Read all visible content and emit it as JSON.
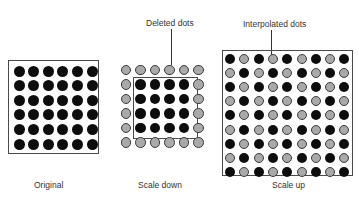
{
  "panels": {
    "original": {
      "caption": "Original",
      "rows": 6,
      "cols": 6,
      "pattern": "all-black"
    },
    "scale_down": {
      "caption": "Scale down",
      "callout": "Deleted dots",
      "rows": 6,
      "cols": 6,
      "pattern": "outer ring gray (deleted), inner 4x4 black (kept)"
    },
    "scale_up": {
      "caption": "Scale up",
      "callout": "Interpolated dots",
      "rows": 9,
      "cols": 9,
      "pattern": "checkerboard: black where (row+col) even, gray (interpolated) where odd"
    }
  },
  "colors": {
    "original_dot": "#0d0d0d",
    "interpolated_dot": "#a9a9a9",
    "outline": "#4a4a4a"
  }
}
